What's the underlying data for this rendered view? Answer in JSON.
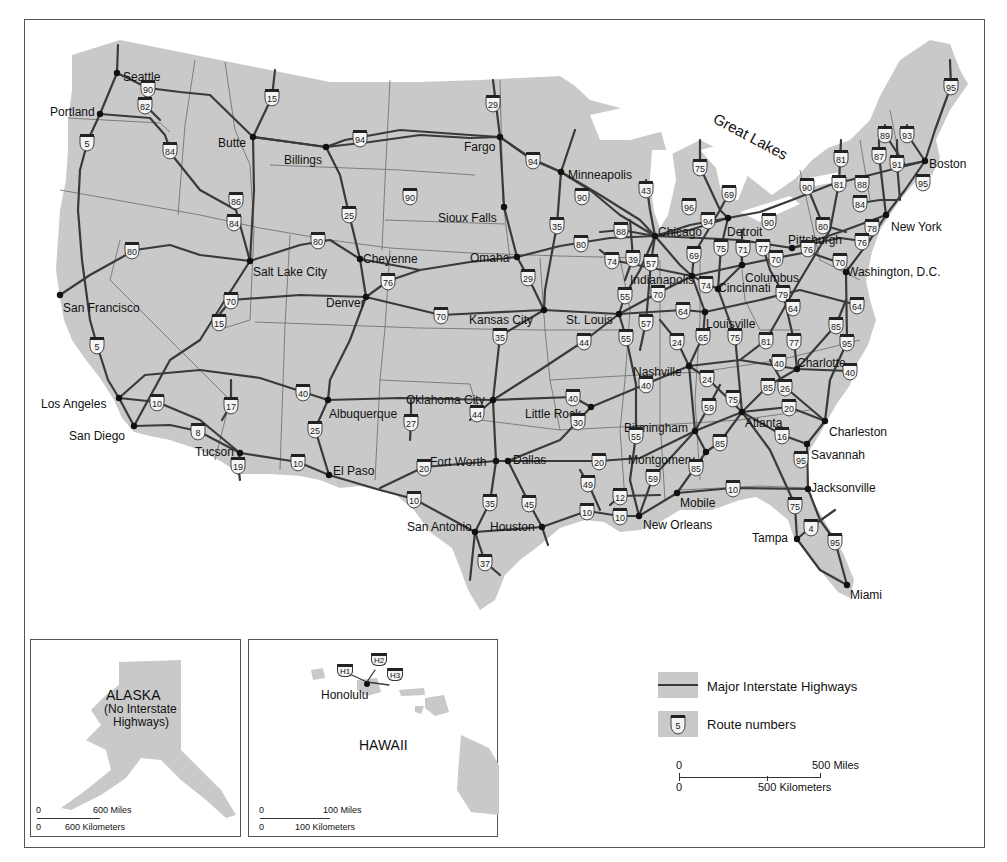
{
  "map": {
    "region_label": "Great Lakes",
    "cities": [
      {
        "name": "Seattle",
        "x": 117,
        "y": 73,
        "lx": 123,
        "ly": 77
      },
      {
        "name": "Portland",
        "x": 100,
        "y": 114,
        "lx": 50,
        "ly": 112
      },
      {
        "name": "Butte",
        "x": 253,
        "y": 137,
        "lx": 218,
        "ly": 143
      },
      {
        "name": "Billings",
        "x": 326,
        "y": 147,
        "lx": 284,
        "ly": 160
      },
      {
        "name": "Fargo",
        "x": 500,
        "y": 137,
        "lx": 464,
        "ly": 147
      },
      {
        "name": "Minneapolis",
        "x": 561,
        "y": 172,
        "lx": 568,
        "ly": 175
      },
      {
        "name": "Sioux Falls",
        "x": 504,
        "y": 207,
        "lx": 438,
        "ly": 218
      },
      {
        "name": "Omaha",
        "x": 517,
        "y": 257,
        "lx": 470,
        "ly": 258
      },
      {
        "name": "Cheyenne",
        "x": 360,
        "y": 259,
        "lx": 363,
        "ly": 259
      },
      {
        "name": "Salt Lake City",
        "x": 250,
        "y": 261,
        "lx": 253,
        "ly": 272
      },
      {
        "name": "San Francisco",
        "x": 60,
        "y": 295,
        "lx": 63,
        "ly": 308
      },
      {
        "name": "Denver",
        "x": 366,
        "y": 297,
        "lx": 326,
        "ly": 303
      },
      {
        "name": "Kansas City",
        "x": 544,
        "y": 310,
        "lx": 469,
        "ly": 320
      },
      {
        "name": "St. Louis",
        "x": 619,
        "y": 314,
        "lx": 566,
        "ly": 320
      },
      {
        "name": "Chicago",
        "x": 655,
        "y": 236,
        "lx": 658,
        "ly": 232
      },
      {
        "name": "Detroit",
        "x": 728,
        "y": 218,
        "lx": 727,
        "ly": 232
      },
      {
        "name": "Indianapolis",
        "x": 692,
        "y": 276,
        "lx": 630,
        "ly": 280
      },
      {
        "name": "Columbus",
        "x": 742,
        "y": 265,
        "lx": 745,
        "ly": 278
      },
      {
        "name": "Cincinnati",
        "x": 718,
        "y": 289,
        "lx": 718,
        "ly": 288
      },
      {
        "name": "Pittsburgh",
        "x": 792,
        "y": 248,
        "lx": 788,
        "ly": 240
      },
      {
        "name": "New York",
        "x": 886,
        "y": 215,
        "lx": 891,
        "ly": 227
      },
      {
        "name": "Boston",
        "x": 925,
        "y": 161,
        "lx": 929,
        "ly": 164
      },
      {
        "name": "Washington, D.C.",
        "x": 846,
        "y": 272,
        "lx": 847,
        "ly": 272
      },
      {
        "name": "Louisville",
        "x": 705,
        "y": 312,
        "lx": 706,
        "ly": 324
      },
      {
        "name": "Nashville",
        "x": 689,
        "y": 366,
        "lx": 633,
        "ly": 372
      },
      {
        "name": "Charlotte",
        "x": 797,
        "y": 369,
        "lx": 797,
        "ly": 363
      },
      {
        "name": "Atlanta",
        "x": 742,
        "y": 412,
        "lx": 745,
        "ly": 423
      },
      {
        "name": "Birmingham",
        "x": 695,
        "y": 431,
        "lx": 624,
        "ly": 428
      },
      {
        "name": "Montgomery",
        "x": 706,
        "y": 452,
        "lx": 628,
        "ly": 460
      },
      {
        "name": "Charleston",
        "x": 825,
        "y": 421,
        "lx": 829,
        "ly": 432
      },
      {
        "name": "Savannah",
        "x": 807,
        "y": 444,
        "lx": 811,
        "ly": 455
      },
      {
        "name": "Jacksonville",
        "x": 808,
        "y": 489,
        "lx": 811,
        "ly": 488
      },
      {
        "name": "Mobile",
        "x": 677,
        "y": 493,
        "lx": 680,
        "ly": 503
      },
      {
        "name": "New Orleans",
        "x": 639,
        "y": 516,
        "lx": 643,
        "ly": 525
      },
      {
        "name": "Tampa",
        "x": 797,
        "y": 539,
        "lx": 752,
        "ly": 538
      },
      {
        "name": "Miami",
        "x": 847,
        "y": 585,
        "lx": 850,
        "ly": 595
      },
      {
        "name": "Los Angeles",
        "x": 119,
        "y": 398,
        "lx": 41,
        "ly": 404
      },
      {
        "name": "San Diego",
        "x": 134,
        "y": 426,
        "lx": 69,
        "ly": 436
      },
      {
        "name": "Tucson",
        "x": 240,
        "y": 453,
        "lx": 195,
        "ly": 452
      },
      {
        "name": "Albuquerque",
        "x": 328,
        "y": 400,
        "lx": 329,
        "ly": 414
      },
      {
        "name": "El Paso",
        "x": 329,
        "y": 475,
        "lx": 333,
        "ly": 471
      },
      {
        "name": "Oklahoma City",
        "x": 493,
        "y": 400,
        "lx": 406,
        "ly": 400
      },
      {
        "name": "Little Rock",
        "x": 591,
        "y": 407,
        "lx": 525,
        "ly": 414
      },
      {
        "name": "Fort Worth",
        "x": 496,
        "y": 461,
        "lx": 430,
        "ly": 462
      },
      {
        "name": "Dallas",
        "x": 508,
        "y": 461,
        "lx": 513,
        "ly": 460
      },
      {
        "name": "San Antonio",
        "x": 475,
        "y": 532,
        "lx": 407,
        "ly": 527
      },
      {
        "name": "Houston",
        "x": 542,
        "y": 527,
        "lx": 490,
        "ly": 527
      }
    ],
    "shields": [
      {
        "n": "90",
        "x": 148,
        "y": 88
      },
      {
        "n": "82",
        "x": 145,
        "y": 105
      },
      {
        "n": "15",
        "x": 272,
        "y": 97
      },
      {
        "n": "5",
        "x": 87,
        "y": 142
      },
      {
        "n": "84",
        "x": 170,
        "y": 150
      },
      {
        "n": "86",
        "x": 236,
        "y": 200
      },
      {
        "n": "84",
        "x": 234,
        "y": 222
      },
      {
        "n": "80",
        "x": 132,
        "y": 250
      },
      {
        "n": "80",
        "x": 318,
        "y": 240
      },
      {
        "n": "29",
        "x": 493,
        "y": 103
      },
      {
        "n": "94",
        "x": 360,
        "y": 138
      },
      {
        "n": "94",
        "x": 533,
        "y": 160
      },
      {
        "n": "90",
        "x": 410,
        "y": 196
      },
      {
        "n": "90",
        "x": 582,
        "y": 196
      },
      {
        "n": "25",
        "x": 349,
        "y": 214
      },
      {
        "n": "35",
        "x": 557,
        "y": 225
      },
      {
        "n": "80",
        "x": 581,
        "y": 243
      },
      {
        "n": "43",
        "x": 646,
        "y": 189
      },
      {
        "n": "88",
        "x": 621,
        "y": 230
      },
      {
        "n": "29",
        "x": 528,
        "y": 277
      },
      {
        "n": "76",
        "x": 388,
        "y": 281
      },
      {
        "n": "70",
        "x": 231,
        "y": 300
      },
      {
        "n": "15",
        "x": 219,
        "y": 322
      },
      {
        "n": "70",
        "x": 441,
        "y": 315
      },
      {
        "n": "35",
        "x": 500,
        "y": 336
      },
      {
        "n": "44",
        "x": 584,
        "y": 341
      },
      {
        "n": "5",
        "x": 97,
        "y": 345
      },
      {
        "n": "74",
        "x": 612,
        "y": 260
      },
      {
        "n": "39",
        "x": 633,
        "y": 258
      },
      {
        "n": "57",
        "x": 651,
        "y": 262
      },
      {
        "n": "55",
        "x": 625,
        "y": 295
      },
      {
        "n": "70",
        "x": 658,
        "y": 293
      },
      {
        "n": "57",
        "x": 646,
        "y": 322
      },
      {
        "n": "55",
        "x": 626,
        "y": 337
      },
      {
        "n": "64",
        "x": 683,
        "y": 310
      },
      {
        "n": "65",
        "x": 703,
        "y": 336
      },
      {
        "n": "75",
        "x": 735,
        "y": 336
      },
      {
        "n": "24",
        "x": 677,
        "y": 341
      },
      {
        "n": "75",
        "x": 700,
        "y": 167
      },
      {
        "n": "96",
        "x": 689,
        "y": 206
      },
      {
        "n": "69",
        "x": 729,
        "y": 193
      },
      {
        "n": "94",
        "x": 708,
        "y": 220
      },
      {
        "n": "69",
        "x": 694,
        "y": 254
      },
      {
        "n": "75",
        "x": 721,
        "y": 247
      },
      {
        "n": "71",
        "x": 743,
        "y": 248
      },
      {
        "n": "77",
        "x": 763,
        "y": 247
      },
      {
        "n": "90",
        "x": 769,
        "y": 221
      },
      {
        "n": "70",
        "x": 776,
        "y": 258
      },
      {
        "n": "74",
        "x": 706,
        "y": 284
      },
      {
        "n": "79",
        "x": 783,
        "y": 293
      },
      {
        "n": "64",
        "x": 793,
        "y": 307
      },
      {
        "n": "64",
        "x": 857,
        "y": 305
      },
      {
        "n": "80",
        "x": 823,
        "y": 225
      },
      {
        "n": "78",
        "x": 872,
        "y": 227
      },
      {
        "n": "76",
        "x": 862,
        "y": 241
      },
      {
        "n": "76",
        "x": 808,
        "y": 248
      },
      {
        "n": "70",
        "x": 840,
        "y": 261
      },
      {
        "n": "81",
        "x": 841,
        "y": 158
      },
      {
        "n": "81",
        "x": 839,
        "y": 183
      },
      {
        "n": "88",
        "x": 862,
        "y": 183
      },
      {
        "n": "84",
        "x": 860,
        "y": 203
      },
      {
        "n": "90",
        "x": 807,
        "y": 186
      },
      {
        "n": "87",
        "x": 879,
        "y": 155
      },
      {
        "n": "91",
        "x": 897,
        "y": 163
      },
      {
        "n": "89",
        "x": 885,
        "y": 134
      },
      {
        "n": "93",
        "x": 907,
        "y": 134
      },
      {
        "n": "95",
        "x": 951,
        "y": 86
      },
      {
        "n": "95",
        "x": 923,
        "y": 182
      },
      {
        "n": "85",
        "x": 836,
        "y": 325
      },
      {
        "n": "95",
        "x": 847,
        "y": 342
      },
      {
        "n": "40",
        "x": 850,
        "y": 371
      },
      {
        "n": "81",
        "x": 766,
        "y": 340
      },
      {
        "n": "77",
        "x": 794,
        "y": 341
      },
      {
        "n": "40",
        "x": 779,
        "y": 362
      },
      {
        "n": "85",
        "x": 768,
        "y": 386
      },
      {
        "n": "26",
        "x": 785,
        "y": 387
      },
      {
        "n": "20",
        "x": 789,
        "y": 407
      },
      {
        "n": "16",
        "x": 782,
        "y": 435
      },
      {
        "n": "95",
        "x": 801,
        "y": 459
      },
      {
        "n": "40",
        "x": 646,
        "y": 384
      },
      {
        "n": "24",
        "x": 707,
        "y": 378
      },
      {
        "n": "75",
        "x": 733,
        "y": 398
      },
      {
        "n": "59",
        "x": 709,
        "y": 406
      },
      {
        "n": "55",
        "x": 636,
        "y": 435
      },
      {
        "n": "85",
        "x": 720,
        "y": 442
      },
      {
        "n": "85",
        "x": 696,
        "y": 467
      },
      {
        "n": "59",
        "x": 653,
        "y": 477
      },
      {
        "n": "10",
        "x": 733,
        "y": 488
      },
      {
        "n": "12",
        "x": 620,
        "y": 496
      },
      {
        "n": "10",
        "x": 620,
        "y": 516
      },
      {
        "n": "75",
        "x": 795,
        "y": 505
      },
      {
        "n": "4",
        "x": 811,
        "y": 527
      },
      {
        "n": "95",
        "x": 835,
        "y": 541
      },
      {
        "n": "40",
        "x": 573,
        "y": 397
      },
      {
        "n": "30",
        "x": 578,
        "y": 421
      },
      {
        "n": "20",
        "x": 599,
        "y": 461
      },
      {
        "n": "49",
        "x": 588,
        "y": 483
      },
      {
        "n": "10",
        "x": 587,
        "y": 511
      },
      {
        "n": "44",
        "x": 477,
        "y": 413
      },
      {
        "n": "27",
        "x": 411,
        "y": 422
      },
      {
        "n": "40",
        "x": 303,
        "y": 392
      },
      {
        "n": "25",
        "x": 315,
        "y": 429
      },
      {
        "n": "20",
        "x": 424,
        "y": 467
      },
      {
        "n": "10",
        "x": 414,
        "y": 499
      },
      {
        "n": "35",
        "x": 490,
        "y": 502
      },
      {
        "n": "45",
        "x": 529,
        "y": 503
      },
      {
        "n": "37",
        "x": 485,
        "y": 562
      },
      {
        "n": "10",
        "x": 157,
        "y": 402
      },
      {
        "n": "17",
        "x": 231,
        "y": 405
      },
      {
        "n": "8",
        "x": 198,
        "y": 431
      },
      {
        "n": "19",
        "x": 238,
        "y": 465
      },
      {
        "n": "10",
        "x": 298,
        "y": 462
      }
    ]
  },
  "alaska_inset": {
    "title": "ALASKA",
    "note_line1": "(No Interstate",
    "note_line2": "Highways)",
    "scale_zero_top": "0",
    "scale_miles": "600 Miles",
    "scale_zero_bottom": "0",
    "scale_km": "600 Kilometers"
  },
  "hawaii_inset": {
    "title": "HAWAII",
    "city": "Honolulu",
    "routes": [
      "H1",
      "H2",
      "H3"
    ],
    "scale_zero_top": "0",
    "scale_miles": "100 Miles",
    "scale_zero_bottom": "0",
    "scale_km": "100 Kilometers"
  },
  "legend": {
    "highway_label": "Major Interstate Highways",
    "route_label": "Route numbers",
    "route_sample": "5",
    "scale_zero_top": "0",
    "scale_miles": "500 Miles",
    "scale_zero_bottom": "0",
    "scale_km": "500 Kilometers"
  },
  "colors": {
    "land": "#c9c9c9",
    "highway": "#3a3a3a",
    "water": "#ffffff",
    "border": "#555555"
  }
}
